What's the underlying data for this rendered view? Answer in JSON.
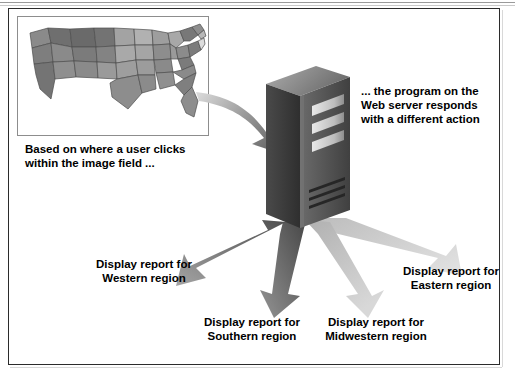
{
  "figure": {
    "type": "diagram",
    "background_color": "#ffffff",
    "frame_color": "#2b2b2b"
  },
  "map_panel": {
    "name": "united-states-image-map",
    "border_color": "#8d8d8d",
    "description": "Grayscale map of the contiguous United States divided into states",
    "shade_dark": "#6f6f6f",
    "shade_mid": "#8a8a8a",
    "shade_light": "#a6a6a6",
    "shade_lighter": "#bdbdbd",
    "state_outline_color": "#4d4d4d"
  },
  "server": {
    "name": "web-server-tower",
    "front_face_color": "#5d5d5d",
    "side_face_color": "#3d3d3d",
    "top_face_color": "#8f8f8f",
    "drive_bay_color": "#d9d9d9",
    "vent_color": "#2a2a2a",
    "drive_bay_count": 3,
    "vent_count": 3
  },
  "captions": {
    "map_caption": "Based on where a user clicks\nwithin the image field ...",
    "server_caption": "... the program on the\nWeb server responds\nwith a different action",
    "western": "Display report for\nWestern region",
    "southern": "Display report for\nSouthern region",
    "midwestern": "Display report for\nMidwestern region",
    "eastern": "Display report for\nEastern region"
  },
  "arrows": {
    "inbound": {
      "name": "map-to-server-arrow",
      "from": "image map",
      "to": "web server",
      "direction": "down-right",
      "fill_start": "#d2d2d2",
      "fill_end": "#6e6e6e"
    },
    "outbound": [
      {
        "name": "arrow-western",
        "target": "Western region",
        "direction": "down-left",
        "fill_start": "#5f5f5f",
        "fill_end": "#9e9e9e"
      },
      {
        "name": "arrow-southern",
        "target": "Southern region",
        "direction": "down-left-steep",
        "fill_start": "#4f4f4f",
        "fill_end": "#8f8f8f"
      },
      {
        "name": "arrow-midwestern",
        "target": "Midwestern region",
        "direction": "down-right-steep",
        "fill_start": "#b5b5b5",
        "fill_end": "#d5d5d5"
      },
      {
        "name": "arrow-eastern",
        "target": "Eastern region",
        "direction": "down-right",
        "fill_start": "#c2c2c2",
        "fill_end": "#dcdcdc"
      }
    ]
  }
}
